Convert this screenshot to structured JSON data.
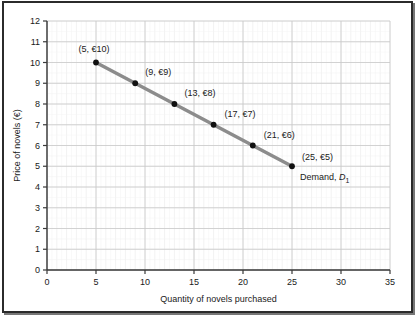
{
  "chart_data": {
    "type": "line",
    "title": "",
    "xlabel": "Quantity of novels purchased",
    "ylabel": "Price of novels (€)",
    "xlim": [
      0,
      35
    ],
    "ylim": [
      0,
      12
    ],
    "xticks": [
      0,
      5,
      10,
      15,
      20,
      25,
      30,
      35
    ],
    "yticks": [
      0,
      1,
      2,
      3,
      4,
      5,
      6,
      7,
      8,
      9,
      10,
      11,
      12
    ],
    "grid": true,
    "grid_minor_step_x": 1,
    "grid_minor_step_y": 1,
    "legend_position": "inline-annotation",
    "series": [
      {
        "name": "Demand, D1",
        "inline_label": "Demand, ",
        "inline_label_symbol": "D",
        "inline_label_subscript": "1",
        "color": "#8c8c8c",
        "marker_color": "#111111",
        "x": [
          5,
          9,
          13,
          17,
          21,
          25
        ],
        "values": [
          10,
          9,
          8,
          7,
          6,
          5
        ],
        "point_labels": [
          "(5, €10)",
          "(9, €9)",
          "(13, €8)",
          "(17, €7)",
          "(21, €6)",
          "(25, €5)"
        ]
      }
    ]
  },
  "axis": {
    "x_tick_labels": [
      "0",
      "5",
      "10",
      "15",
      "20",
      "25",
      "30",
      "35"
    ],
    "y_tick_labels": [
      "0",
      "1",
      "2",
      "3",
      "4",
      "5",
      "6",
      "7",
      "8",
      "9",
      "10",
      "11",
      "12"
    ]
  },
  "colors": {
    "line": "#8c8c8c",
    "marker": "#111111",
    "axis": "#3a3a3a",
    "grid_major": "#c9c9c9",
    "grid_minor": "#e9e9e9",
    "frame": "#2b2b2b",
    "text": "#1a1a1a",
    "background": "#ffffff"
  }
}
